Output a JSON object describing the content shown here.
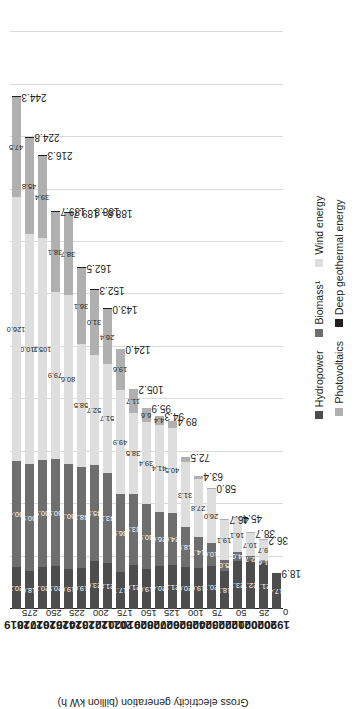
{
  "chart_data": {
    "type": "bar",
    "orientation": "vertical-stacked",
    "title": "",
    "xlabel": "",
    "ylabel": "Gross electricity generation (billion kW h)",
    "ylim": [
      0,
      287.5
    ],
    "yticks": [
      0,
      25,
      50,
      75,
      100,
      125,
      150,
      175,
      200,
      225,
      250,
      275
    ],
    "grid": true,
    "legend_position": "bottom",
    "categories": [
      "1990",
      "2000",
      "2001",
      "2002",
      "2003",
      "2004",
      "2005",
      "2006",
      "2007",
      "2008",
      "2009",
      "2010",
      "2011",
      "2012",
      "2013",
      "2014",
      "2015",
      "2016",
      "2017",
      "2018",
      "2019"
    ],
    "totals": [
      "18.9",
      "36.2",
      "38.7",
      "45.4",
      "46.7",
      "58.0",
      "63.4",
      "72.5",
      "89.4",
      "94.3",
      "95.9",
      "105.2",
      "124.0",
      "143.0",
      "152.3",
      "162.5",
      "188.8 - 189.7",
      "188.8 - 189.7",
      "216.3",
      "224.8",
      "244.3"
    ],
    "series": [
      {
        "name": "Hydropower",
        "color": "#4d4d4d",
        "values": [
          17.4,
          21.7,
          22.7,
          23.1,
          18.3,
          20.7,
          19.6,
          20.0,
          21.2,
          20.4,
          19.0,
          21.0,
          17.7,
          21.8,
          23.0,
          19.6,
          19.0,
          20.5,
          20.2,
          18.0,
          20.2
        ],
        "labels": [
          "17.4",
          "21.7",
          "22.7",
          "23.1",
          "18.3",
          "20.7",
          "19.6",
          "20.0",
          "21.2",
          "20.4",
          "19.0",
          "21.0",
          "17.7",
          "21.8",
          "23.0",
          "19.6",
          "19.0",
          "20.5",
          "20.2",
          "18.0",
          "20.2"
        ]
      },
      {
        "name": "Biomass¹",
        "color": "#6e6e6e",
        "values": [
          0.0,
          1.6,
          2.7,
          4.0,
          5.0,
          10.6,
          14.7,
          18.9,
          24.6,
          26.0,
          30.9,
          33.9,
          36.9,
          43.2,
          45.5,
          48.3,
          50.3,
          50.9,
          50.9,
          50.9,
          50.4
        ],
        "labels": [
          "",
          "1.6",
          "2.7",
          "4.0",
          "5.0",
          "10.6",
          "14.7",
          "18.9",
          "24.6",
          "26.0",
          "30.9",
          "33.9",
          "36.9",
          "43.2",
          "45.5",
          "48.3",
          "50.3",
          "50.9",
          "50.9",
          "50.9",
          "50.4"
        ]
      },
      {
        "name": "Wind energy",
        "color": "#dedede",
        "values": [
          0.0,
          9.7,
          10.7,
          16.1,
          19.1,
          26.0,
          27.8,
          31.3,
          40.5,
          41.4,
          39.4,
          38.5,
          49.9,
          51.7,
          52.7,
          58.5,
          80.6,
          79.9,
          105.7,
          110.0,
          126.0
        ],
        "labels": [
          "",
          "9.7",
          "10.7",
          "16.1",
          "19.1",
          "26.0",
          "27.8",
          "31.3",
          "40.5",
          "41.4",
          "39.4",
          "38.5",
          "49.9",
          "51.7",
          "52.7",
          "58.5",
          "80.6",
          "79.9",
          "105.7",
          "110.0",
          "126.0"
        ]
      },
      {
        "name": "Photovoltaics",
        "color": "#b0b0b0",
        "values": [
          0.0,
          0.1,
          0.1,
          0.2,
          0.3,
          0.6,
          1.3,
          2.2,
          3.1,
          4.4,
          6.6,
          11.7,
          19.6,
          26.4,
          31.0,
          36.1,
          38.7,
          38.1,
          39.4,
          45.8,
          47.5
        ],
        "labels": [
          "",
          "",
          "",
          "",
          "",
          "",
          "",
          "",
          "",
          "4.4",
          "6.6",
          "11.7",
          "19.6",
          "26.4",
          "31.0",
          "36.1",
          "38.7",
          "38.1",
          "39.4",
          "45.8",
          "47.5"
        ]
      },
      {
        "name": "Deep geothermal energy",
        "color": "#231f20",
        "values": [
          0.0,
          0.0,
          0.0,
          0.0,
          0.0,
          0.0,
          0.0,
          0.0,
          0.0,
          0.0,
          0.0,
          0.0,
          0.0,
          0.1,
          0.1,
          0.1,
          0.1,
          0.2,
          0.2,
          0.2,
          0.2
        ],
        "labels": [
          "",
          "",
          "",
          "",
          "",
          "",
          "",
          "",
          "",
          "",
          "",
          "",
          "",
          "",
          "",
          "",
          "",
          "",
          "",
          "",
          ""
        ]
      }
    ]
  },
  "legend": {
    "row1": [
      "Hydropower",
      "Biomass¹",
      "Wind energy"
    ],
    "row2": [
      "Photovoltaics",
      "Deep geothermal energy"
    ]
  }
}
